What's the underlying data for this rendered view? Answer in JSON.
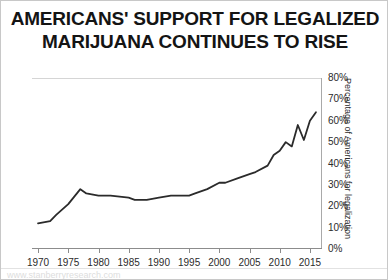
{
  "title": {
    "line1": "AMERICANS' SUPPORT FOR LEGALIZED",
    "line2": "MARIJUANA CONTINUES TO RISE"
  },
  "footer": {
    "watermark": "www.stanberryresearch.com"
  },
  "colors": {
    "line": "#2b2b2b",
    "axis": "#8c8c8c",
    "grid": "#d5d5d5",
    "text": "#2b2b2b",
    "title": "#141414",
    "background": "#ffffff",
    "border": "#c8c8c8"
  },
  "chart_data": {
    "type": "line",
    "title": "AMERICANS' SUPPORT FOR LEGALIZED MARIJUANA CONTINUES TO RISE",
    "xlabel": "",
    "ylabel": "Percentage of Americans for legalization",
    "xlim": [
      1969,
      2017
    ],
    "ylim": [
      0,
      80
    ],
    "ytick_labels": [
      "0%",
      "10%",
      "20%",
      "30%",
      "40%",
      "50%",
      "60%",
      "70%",
      "80%"
    ],
    "ytick_values": [
      0,
      10,
      20,
      30,
      40,
      50,
      60,
      70,
      80
    ],
    "xtick_labels": [
      "1970",
      "1975",
      "1980",
      "1985",
      "1990",
      "1995",
      "2000",
      "2005",
      "2010",
      "2015"
    ],
    "xtick_values": [
      1970,
      1975,
      1980,
      1985,
      1990,
      1995,
      2000,
      2005,
      2010,
      2015
    ],
    "grid": false,
    "legend": "none",
    "series": [
      {
        "name": "Percentage of Americans for legalization",
        "x": [
          1970,
          1972,
          1973,
          1975,
          1977,
          1978,
          1980,
          1982,
          1985,
          1986,
          1988,
          1990,
          1992,
          1995,
          1996,
          1998,
          2000,
          2001,
          2003,
          2005,
          2006,
          2008,
          2009,
          2010,
          2011,
          2012,
          2013,
          2014,
          2015,
          2016
        ],
        "values": [
          12,
          13,
          16,
          21,
          28,
          26,
          25,
          25,
          24,
          23,
          23,
          24,
          25,
          25,
          26,
          28,
          31,
          31,
          33,
          35,
          36,
          39,
          44,
          46,
          50,
          48,
          58,
          51,
          60,
          64
        ]
      }
    ]
  }
}
